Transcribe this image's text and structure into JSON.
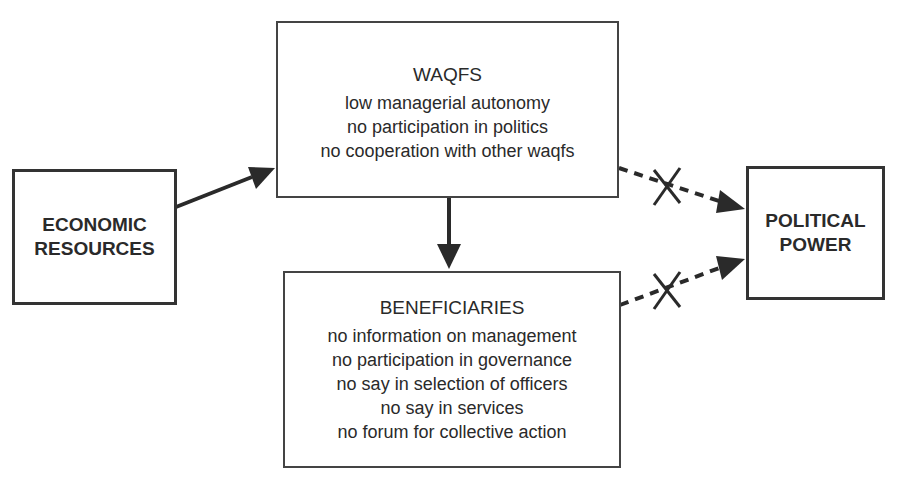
{
  "diagram": {
    "nodes": {
      "economic": {
        "lines": [
          "ECONOMIC",
          "RESOURCES"
        ]
      },
      "waqfs": {
        "title": "WAQFS",
        "items": [
          "low managerial autonomy",
          "no participation in politics",
          "no cooperation with other waqfs"
        ]
      },
      "beneficiaries": {
        "title": "BENEFICIARIES",
        "items": [
          "no information on management",
          "no participation in governance",
          "no say in selection of officers",
          "no say in services",
          "no forum for collective action"
        ]
      },
      "political": {
        "lines": [
          "POLITICAL",
          "POWER"
        ]
      }
    },
    "edges": [
      {
        "from": "economic",
        "to": "waqfs",
        "style": "solid"
      },
      {
        "from": "waqfs",
        "to": "beneficiaries",
        "style": "solid"
      },
      {
        "from": "waqfs",
        "to": "political",
        "style": "dotted",
        "blocked": true,
        "marker": "X"
      },
      {
        "from": "beneficiaries",
        "to": "political",
        "style": "dotted",
        "blocked": true,
        "marker": "X"
      }
    ]
  }
}
